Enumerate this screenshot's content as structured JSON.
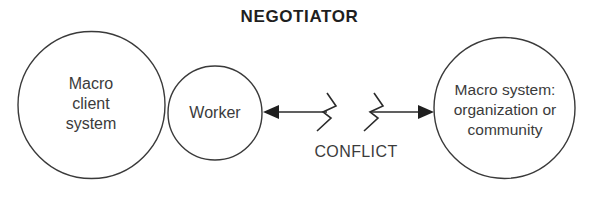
{
  "diagram": {
    "title": "NEGOTIATOR",
    "nodes": {
      "macro_client_system": "Macro\nclient\nsystem",
      "worker": "Worker",
      "macro_system": "Macro system:\norganization or\ncommunity"
    },
    "connector": {
      "label": "CONFLICT",
      "style": "double-headed-arrow-with-break",
      "break_symbol": "lightning-zigzag"
    },
    "colors": {
      "stroke": "#3a3a3a",
      "text": "#3b3b3b",
      "title_text": "#1f1f1f",
      "background": "#ffffff"
    }
  }
}
